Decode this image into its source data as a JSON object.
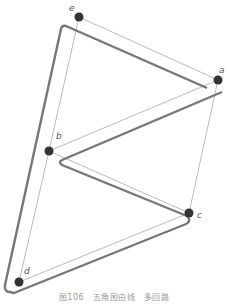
{
  "figure": {
    "caption": "图106　五角图由线　多回路",
    "points": [
      {
        "label": "e",
        "x": 79,
        "y": 17
      },
      {
        "label": "a",
        "x": 218,
        "y": 80
      },
      {
        "label": "b",
        "x": 49,
        "y": 151
      },
      {
        "label": "c",
        "x": 189,
        "y": 213
      },
      {
        "label": "d",
        "x": 19,
        "y": 282
      }
    ],
    "colors": {
      "outline": "#777777",
      "thin_line": "#aaaaaa",
      "point": "#333333"
    }
  }
}
